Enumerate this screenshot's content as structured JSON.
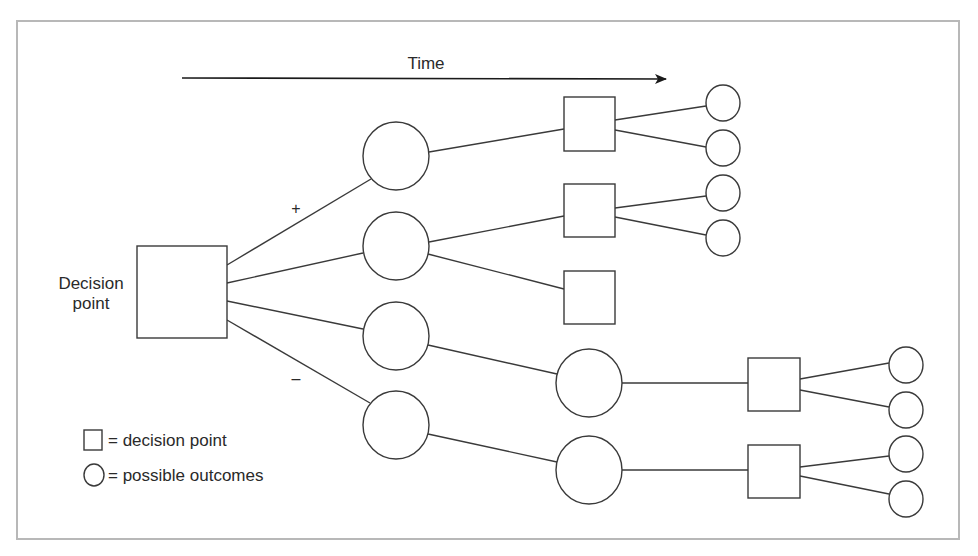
{
  "diagram": {
    "time_label": "Time",
    "root_label_line1": "Decision",
    "root_label_line2": "point",
    "plus_label": "+",
    "minus_label": "–",
    "legend": {
      "square_text": "= decision point",
      "circle_text": "= possible outcomes"
    },
    "colors": {
      "stroke": "#3a3a3a",
      "frame": "#b8b8b8",
      "background": "#ffffff"
    },
    "nodes": [
      {
        "id": "root",
        "type": "decision",
        "x": 137,
        "y": 246,
        "w": 90,
        "h": 92
      },
      {
        "id": "o1",
        "type": "outcome",
        "cx": 396,
        "cy": 156,
        "rx": 33,
        "ry": 34
      },
      {
        "id": "o2",
        "type": "outcome",
        "cx": 396,
        "cy": 246,
        "rx": 33,
        "ry": 34
      },
      {
        "id": "o3",
        "type": "outcome",
        "cx": 396,
        "cy": 336,
        "rx": 33,
        "ry": 34
      },
      {
        "id": "o4",
        "type": "outcome",
        "cx": 396,
        "cy": 425,
        "rx": 33,
        "ry": 34
      },
      {
        "id": "d1",
        "type": "decision",
        "x": 564,
        "y": 97,
        "w": 51,
        "h": 54
      },
      {
        "id": "d2",
        "type": "decision",
        "x": 564,
        "y": 184,
        "w": 51,
        "h": 53
      },
      {
        "id": "d3",
        "type": "decision",
        "x": 564,
        "y": 271,
        "w": 51,
        "h": 53
      },
      {
        "id": "o5",
        "type": "outcome",
        "cx": 589,
        "cy": 383,
        "rx": 33,
        "ry": 34
      },
      {
        "id": "o6",
        "type": "outcome",
        "cx": 589,
        "cy": 470,
        "rx": 33,
        "ry": 34
      },
      {
        "id": "d4",
        "type": "decision",
        "x": 748,
        "y": 358,
        "w": 52,
        "h": 53
      },
      {
        "id": "d5",
        "type": "decision",
        "x": 748,
        "y": 445,
        "w": 52,
        "h": 53
      },
      {
        "id": "l1",
        "type": "outcome",
        "cx": 723,
        "cy": 103,
        "rx": 17,
        "ry": 18
      },
      {
        "id": "l2",
        "type": "outcome",
        "cx": 723,
        "cy": 148,
        "rx": 17,
        "ry": 18
      },
      {
        "id": "l3",
        "type": "outcome",
        "cx": 723,
        "cy": 193,
        "rx": 17,
        "ry": 18
      },
      {
        "id": "l4",
        "type": "outcome",
        "cx": 723,
        "cy": 238,
        "rx": 17,
        "ry": 18
      },
      {
        "id": "l5",
        "type": "outcome",
        "cx": 906,
        "cy": 365,
        "rx": 17,
        "ry": 18
      },
      {
        "id": "l6",
        "type": "outcome",
        "cx": 906,
        "cy": 410,
        "rx": 17,
        "ry": 18
      },
      {
        "id": "l7",
        "type": "outcome",
        "cx": 906,
        "cy": 454,
        "rx": 17,
        "ry": 18
      },
      {
        "id": "l8",
        "type": "outcome",
        "cx": 906,
        "cy": 499,
        "rx": 17,
        "ry": 18
      }
    ],
    "edges": [
      {
        "from": "root",
        "to": "o1",
        "x1": 227,
        "y1": 265,
        "x2": 371,
        "y2": 179
      },
      {
        "from": "root",
        "to": "o2",
        "x1": 227,
        "y1": 283,
        "x2": 363,
        "y2": 253
      },
      {
        "from": "root",
        "to": "o3",
        "x1": 227,
        "y1": 301,
        "x2": 363,
        "y2": 329
      },
      {
        "from": "root",
        "to": "o4",
        "x1": 227,
        "y1": 320,
        "x2": 370,
        "y2": 403
      },
      {
        "from": "o1",
        "to": "d1",
        "x1": 429,
        "y1": 152,
        "x2": 564,
        "y2": 129
      },
      {
        "from": "o2",
        "to": "d2",
        "x1": 429,
        "y1": 242,
        "x2": 564,
        "y2": 216
      },
      {
        "from": "o2",
        "to": "d3",
        "x1": 428,
        "y1": 254,
        "x2": 564,
        "y2": 289
      },
      {
        "from": "o3",
        "to": "o5",
        "x1": 428,
        "y1": 345,
        "x2": 557,
        "y2": 374
      },
      {
        "from": "o4",
        "to": "o6",
        "x1": 428,
        "y1": 434,
        "x2": 557,
        "y2": 462
      },
      {
        "from": "d1",
        "to": "l1",
        "x1": 615,
        "y1": 120,
        "x2": 706,
        "y2": 106
      },
      {
        "from": "d1",
        "to": "l2",
        "x1": 615,
        "y1": 130,
        "x2": 706,
        "y2": 147
      },
      {
        "from": "d2",
        "to": "l3",
        "x1": 615,
        "y1": 208,
        "x2": 706,
        "y2": 196
      },
      {
        "from": "d2",
        "to": "l4",
        "x1": 615,
        "y1": 217,
        "x2": 706,
        "y2": 235
      },
      {
        "from": "o5",
        "to": "d4",
        "x1": 622,
        "y1": 383,
        "x2": 748,
        "y2": 383
      },
      {
        "from": "o6",
        "to": "d5",
        "x1": 622,
        "y1": 470,
        "x2": 748,
        "y2": 470
      },
      {
        "from": "d4",
        "to": "l5",
        "x1": 800,
        "y1": 379,
        "x2": 889,
        "y2": 363
      },
      {
        "from": "d4",
        "to": "l6",
        "x1": 800,
        "y1": 390,
        "x2": 889,
        "y2": 407
      },
      {
        "from": "d5",
        "to": "l7",
        "x1": 800,
        "y1": 467,
        "x2": 889,
        "y2": 456
      },
      {
        "from": "d5",
        "to": "l8",
        "x1": 800,
        "y1": 476,
        "x2": 889,
        "y2": 494
      }
    ]
  }
}
